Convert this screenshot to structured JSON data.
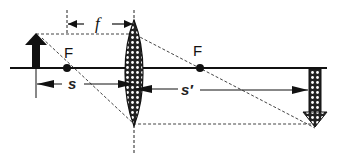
{
  "diagram": {
    "labels": {
      "focal_left": "F",
      "focal_right": "F",
      "focal_length": "f",
      "object_distance": "s",
      "image_distance": "s′"
    },
    "elements": {
      "object": "upright object arrow",
      "image": "inverted real image arrow",
      "lens": "converging lens",
      "axis": "optical axis"
    },
    "colors": {
      "ink": "#111111",
      "background": "#ffffff"
    }
  }
}
